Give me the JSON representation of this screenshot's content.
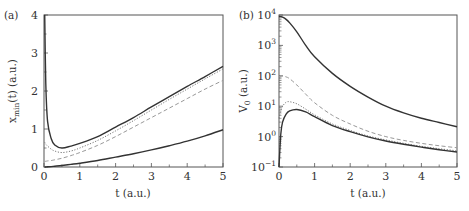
{
  "chart_data": [
    {
      "panel": "(a)",
      "type": "line",
      "title": "",
      "xlabel": "t (a.u.)",
      "ylabel": "x_min(t) (a.u.)",
      "ylabel_main": "x",
      "ylabel_sub": "min",
      "ylabel_rest": "(t) (a.u.)",
      "xlim": [
        0,
        5
      ],
      "ylim": [
        0,
        4
      ],
      "xticks": [
        "0",
        "1",
        "2",
        "3",
        "4",
        "5"
      ],
      "yticks": [
        "0",
        "1",
        "2",
        "3",
        "4"
      ],
      "grid": false,
      "legend": "none",
      "x": [
        0.02,
        0.05,
        0.1,
        0.2,
        0.3,
        0.5,
        0.75,
        1,
        1.5,
        2,
        2.5,
        3,
        3.5,
        4,
        4.5,
        5
      ],
      "series": [
        {
          "name": "solid-upper",
          "style": "solid",
          "color": "#333333",
          "values": [
            4.0,
            2.2,
            1.2,
            0.75,
            0.58,
            0.5,
            0.55,
            0.62,
            0.8,
            1.05,
            1.3,
            1.58,
            1.85,
            2.12,
            2.38,
            2.65
          ]
        },
        {
          "name": "dotted",
          "style": "dotted",
          "color": "#777777",
          "values": [
            0.65,
            0.6,
            0.55,
            0.47,
            0.42,
            0.38,
            0.42,
            0.5,
            0.7,
            0.95,
            1.22,
            1.5,
            1.78,
            2.05,
            2.32,
            2.58
          ]
        },
        {
          "name": "dashed",
          "style": "dashed",
          "color": "#999999",
          "values": [
            0.15,
            0.15,
            0.16,
            0.17,
            0.19,
            0.23,
            0.3,
            0.38,
            0.57,
            0.8,
            1.05,
            1.3,
            1.55,
            1.8,
            2.05,
            2.28
          ]
        },
        {
          "name": "solid-lower",
          "style": "solid",
          "color": "#333333",
          "values": [
            0.0,
            0.0,
            0.005,
            0.01,
            0.02,
            0.04,
            0.07,
            0.1,
            0.17,
            0.26,
            0.35,
            0.45,
            0.56,
            0.68,
            0.82,
            0.98
          ]
        }
      ]
    },
    {
      "panel": "(b)",
      "type": "line",
      "title": "",
      "xlabel": "t (a.u.)",
      "ylabel": "V_0 (a.u.)",
      "ylabel_main": "V",
      "ylabel_sub": "0",
      "ylabel_rest": " (a.u.)",
      "xlim": [
        0,
        5
      ],
      "ylim": [
        0.1,
        10000
      ],
      "yscale": "log",
      "xticks": [
        "0",
        "1",
        "2",
        "3",
        "4",
        "5"
      ],
      "yticks": [
        "10^-1",
        "10^0",
        "10^1",
        "10^2",
        "10^3",
        "10^4"
      ],
      "ytick_base": "10",
      "ytick_exps": [
        "−1",
        "0",
        "1",
        "2",
        "3",
        "4"
      ],
      "grid": false,
      "legend": "none",
      "x": [
        0.0,
        0.05,
        0.1,
        0.2,
        0.3,
        0.5,
        0.75,
        1,
        1.5,
        2,
        2.5,
        3,
        3.5,
        4,
        4.5,
        5
      ],
      "series": [
        {
          "name": "solid-upper",
          "style": "solid",
          "color": "#333333",
          "values": [
            9000,
            8800,
            8500,
            7200,
            5500,
            2800,
            1000,
            420,
            120,
            45,
            20,
            10,
            6,
            4,
            2.9,
            2.1
          ]
        },
        {
          "name": "dashed",
          "style": "dashed",
          "color": "#999999",
          "values": [
            95,
            97,
            98,
            92,
            80,
            50,
            25,
            13,
            5,
            2.6,
            1.5,
            1.0,
            0.75,
            0.6,
            0.5,
            0.43
          ]
        },
        {
          "name": "dotted",
          "style": "dotted",
          "color": "#777777",
          "values": [
            4,
            7,
            10,
            13.5,
            14,
            12,
            8,
            5.2,
            2.6,
            1.6,
            1.05,
            0.78,
            0.6,
            0.48,
            0.4,
            0.34
          ]
        },
        {
          "name": "solid-lower",
          "style": "solid",
          "color": "#333333",
          "values": [
            0.1,
            1.2,
            3.0,
            5.5,
            7.0,
            7.8,
            6.5,
            4.5,
            2.3,
            1.45,
            0.98,
            0.72,
            0.56,
            0.45,
            0.37,
            0.31
          ]
        }
      ]
    }
  ]
}
